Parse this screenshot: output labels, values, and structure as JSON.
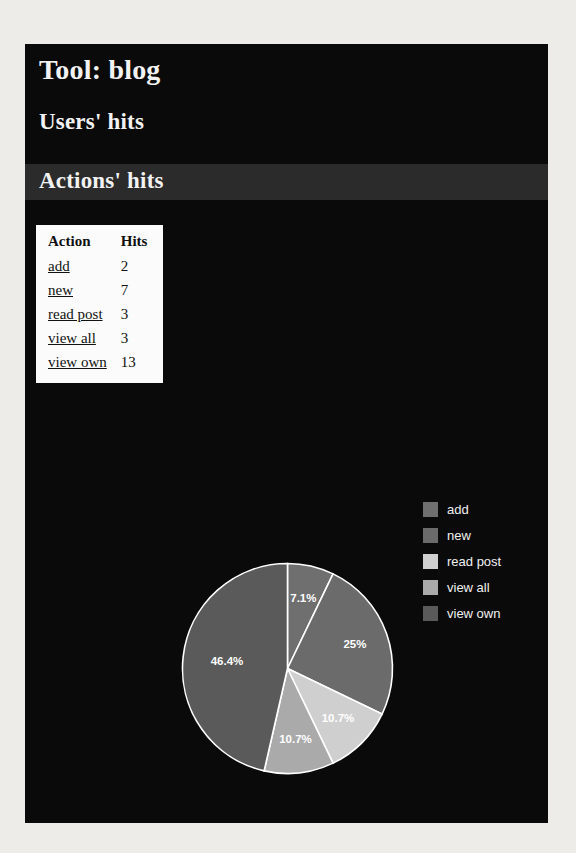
{
  "page": {
    "tool_title": "Tool: blog",
    "users_hits_heading": "Users' hits",
    "actions_hits_heading": "Actions' hits",
    "panel_background": "#0a0a0a",
    "band_background": "#2b2b2b",
    "heading_color": "#f2f2f2"
  },
  "table": {
    "columns": [
      "Action",
      "Hits"
    ],
    "rows": [
      {
        "action": "add",
        "hits": "2"
      },
      {
        "action": "new",
        "hits": "7"
      },
      {
        "action": "read post",
        "hits": "3"
      },
      {
        "action": "view all",
        "hits": "3"
      },
      {
        "action": "view own",
        "hits": "13"
      }
    ]
  },
  "legend": {
    "items": [
      {
        "label": "add",
        "color": "#6f6f6f"
      },
      {
        "label": "new",
        "color": "#6b6b6b"
      },
      {
        "label": "read post",
        "color": "#cfcfcf"
      },
      {
        "label": "view all",
        "color": "#aaaaaa"
      },
      {
        "label": "view own",
        "color": "#5a5a5a"
      }
    ]
  },
  "chart_data": {
    "type": "pie",
    "title": "Actions' hits",
    "categories": [
      "add",
      "new",
      "read post",
      "view all",
      "view own"
    ],
    "values": [
      2,
      7,
      3,
      3,
      13
    ],
    "total": 28,
    "percent_labels": [
      "7.1%",
      "25%",
      "10.7%",
      "10.7%",
      "46.4%"
    ],
    "percents": [
      7.1,
      25.0,
      10.7,
      10.7,
      46.4
    ],
    "colors": [
      "#6f6f6f",
      "#6b6b6b",
      "#cfcfcf",
      "#aaaaaa",
      "#5a5a5a"
    ],
    "start_angle_deg": 0,
    "direction": "clockwise",
    "label_color": "#ffffff",
    "separator_color": "#ffffff",
    "legend_position": "right",
    "grid": false
  }
}
